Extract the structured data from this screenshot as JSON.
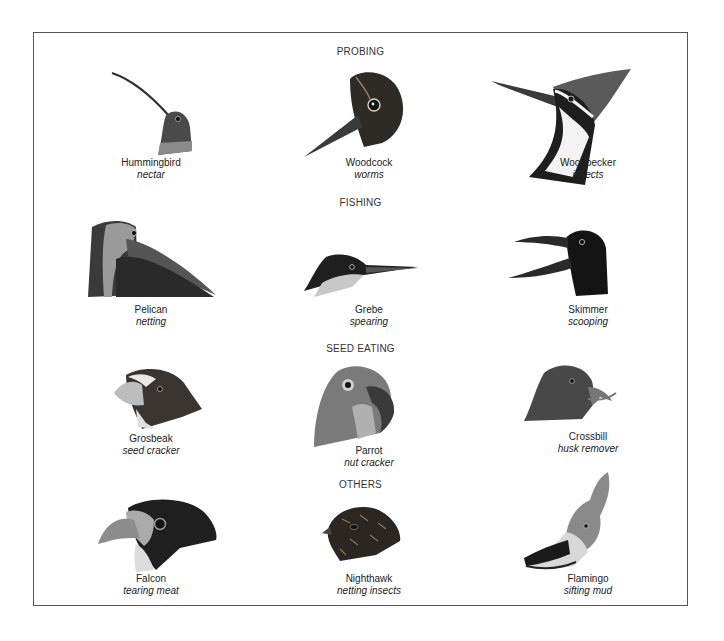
{
  "sections": [
    {
      "title": "PROBING",
      "birds": [
        {
          "name": "Hummingbird",
          "diet": "nectar",
          "icon": "hummingbird-head"
        },
        {
          "name": "Woodcock",
          "diet": "worms",
          "icon": "woodcock-head"
        },
        {
          "name": "Woodpecker",
          "diet": "insects",
          "icon": "woodpecker-head"
        }
      ]
    },
    {
      "title": "FISHING",
      "birds": [
        {
          "name": "Pelican",
          "diet": "netting",
          "icon": "pelican-head"
        },
        {
          "name": "Grebe",
          "diet": "spearing",
          "icon": "grebe-head"
        },
        {
          "name": "Skimmer",
          "diet": "scooping",
          "icon": "skimmer-head"
        }
      ]
    },
    {
      "title": "SEED EATING",
      "birds": [
        {
          "name": "Grosbeak",
          "diet": "seed cracker",
          "icon": "grosbeak-head"
        },
        {
          "name": "Parrot",
          "diet": "nut cracker",
          "icon": "parrot-head"
        },
        {
          "name": "Crossbill",
          "diet": "husk remover",
          "icon": "crossbill-head"
        }
      ]
    },
    {
      "title": "OTHERS",
      "birds": [
        {
          "name": "Falcon",
          "diet": "tearing meat",
          "icon": "falcon-head"
        },
        {
          "name": "Nighthawk",
          "diet": "netting insects",
          "icon": "nighthawk-head"
        },
        {
          "name": "Flamingo",
          "diet": "sifting mud",
          "icon": "flamingo-head"
        }
      ]
    }
  ],
  "colors": {
    "border": "#555555",
    "text": "#222222",
    "bird_dark": "#2a2a2a",
    "bird_mid": "#6a6a6a",
    "bird_light": "#b8b8b8"
  }
}
